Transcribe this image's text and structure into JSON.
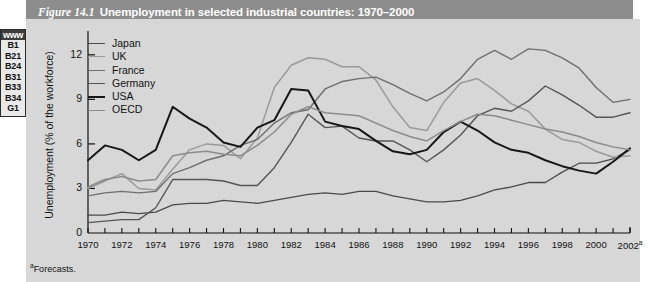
{
  "margin_tab": {
    "www_label": "www",
    "codes": [
      "B1",
      "B21",
      "B24",
      "B31",
      "B33",
      "B34",
      "G1"
    ]
  },
  "header": {
    "figure_number": "Figure 14.1",
    "title": "Unemployment in selected industrial countries: 1970–2000"
  },
  "footnote": {
    "marker": "a",
    "text": "Forecasts."
  },
  "chart_data": {
    "type": "line",
    "title": "Unemployment in selected industrial countries: 1970–2000",
    "xlabel": "",
    "ylabel": "Unemployment (% of the workforce)",
    "ylim": [
      0,
      13.2
    ],
    "yticks": [
      0,
      3,
      6,
      9,
      12
    ],
    "ytick_labels": [
      "0",
      "3",
      "6",
      "9",
      "12"
    ],
    "xlim": [
      1970,
      2002
    ],
    "xticks": [
      1970,
      1971,
      1972,
      1973,
      1974,
      1975,
      1976,
      1977,
      1978,
      1979,
      1980,
      1981,
      1982,
      1983,
      1984,
      1985,
      1986,
      1987,
      1988,
      1989,
      1990,
      1991,
      1992,
      1993,
      1994,
      1995,
      1996,
      1997,
      1998,
      1999,
      2000,
      2001,
      2002
    ],
    "xtick_labels": [
      "1970",
      "1972",
      "1974",
      "1976",
      "1978",
      "1980",
      "1982",
      "1984",
      "1986",
      "1988",
      "1990",
      "1992",
      "1994",
      "1996",
      "1998",
      "2000",
      "2002"
    ],
    "xtick_label_values": [
      1970,
      1972,
      1974,
      1976,
      1978,
      1980,
      1982,
      1984,
      1986,
      1988,
      1990,
      1992,
      1994,
      1996,
      1998,
      2000,
      2002
    ],
    "xtick_label_superscript_last": "a",
    "grid": false,
    "legend_position": "top-left",
    "x": [
      1970,
      1971,
      1972,
      1973,
      1974,
      1975,
      1976,
      1977,
      1978,
      1979,
      1980,
      1981,
      1982,
      1983,
      1984,
      1985,
      1986,
      1987,
      1988,
      1989,
      1990,
      1991,
      1992,
      1993,
      1994,
      1995,
      1996,
      1997,
      1998,
      1999,
      2000,
      2001,
      2002
    ],
    "series": [
      {
        "name": "Japan",
        "color": "#4a4a4a",
        "width": 1.3,
        "values": [
          1.2,
          1.2,
          1.4,
          1.3,
          1.4,
          1.9,
          2.0,
          2.0,
          2.2,
          2.1,
          2.0,
          2.2,
          2.4,
          2.6,
          2.7,
          2.6,
          2.8,
          2.8,
          2.5,
          2.3,
          2.1,
          2.1,
          2.2,
          2.5,
          2.9,
          3.1,
          3.4,
          3.4,
          4.1,
          4.7,
          4.7,
          5.0,
          5.6
        ]
      },
      {
        "name": "UK",
        "color": "#9a9a9a",
        "width": 1.5,
        "values": [
          3.0,
          3.5,
          4.0,
          3.0,
          2.9,
          4.3,
          5.6,
          6.0,
          5.9,
          5.0,
          6.4,
          9.8,
          11.3,
          11.8,
          11.7,
          11.2,
          11.2,
          10.3,
          8.5,
          7.1,
          6.9,
          8.8,
          10.1,
          10.4,
          9.6,
          8.7,
          8.2,
          7.0,
          6.3,
          6.1,
          5.5,
          5.1,
          5.2
        ]
      },
      {
        "name": "France",
        "color": "#6e6e6e",
        "width": 1.4,
        "values": [
          2.5,
          2.7,
          2.8,
          2.7,
          2.8,
          4.0,
          4.4,
          4.9,
          5.2,
          5.9,
          6.3,
          7.4,
          8.1,
          8.3,
          9.7,
          10.2,
          10.4,
          10.5,
          10.0,
          9.4,
          8.9,
          9.5,
          10.4,
          11.7,
          12.3,
          11.7,
          12.4,
          12.3,
          11.8,
          11.1,
          9.8,
          8.8,
          9.0
        ]
      },
      {
        "name": "Germany",
        "color": "#555555",
        "width": 1.4,
        "values": [
          0.7,
          0.8,
          0.9,
          0.9,
          1.7,
          3.6,
          3.6,
          3.6,
          3.5,
          3.2,
          3.2,
          4.4,
          6.1,
          8.0,
          7.1,
          7.2,
          6.4,
          6.2,
          6.2,
          5.6,
          4.8,
          5.6,
          6.6,
          7.9,
          8.4,
          8.2,
          8.9,
          9.9,
          9.3,
          8.6,
          7.8,
          7.8,
          8.1
        ]
      },
      {
        "name": "USA",
        "color": "#171717",
        "width": 2.0,
        "values": [
          4.9,
          5.9,
          5.6,
          4.9,
          5.6,
          8.5,
          7.7,
          7.1,
          6.1,
          5.8,
          7.1,
          7.6,
          9.7,
          9.6,
          7.5,
          7.2,
          7.0,
          6.2,
          5.5,
          5.3,
          5.6,
          6.8,
          7.5,
          6.9,
          6.1,
          5.6,
          5.4,
          4.9,
          4.5,
          4.2,
          4.0,
          4.8,
          5.7
        ]
      },
      {
        "name": "OECD",
        "color": "#8b8b8b",
        "width": 1.5,
        "values": [
          3.1,
          3.6,
          3.8,
          3.5,
          3.6,
          5.2,
          5.4,
          5.5,
          5.3,
          5.2,
          5.9,
          6.8,
          8.0,
          8.5,
          8.1,
          8.0,
          7.9,
          7.4,
          6.9,
          6.5,
          6.2,
          6.9,
          7.5,
          8.0,
          7.9,
          7.6,
          7.3,
          7.0,
          6.8,
          6.5,
          6.1,
          5.8,
          5.6
        ]
      }
    ]
  }
}
